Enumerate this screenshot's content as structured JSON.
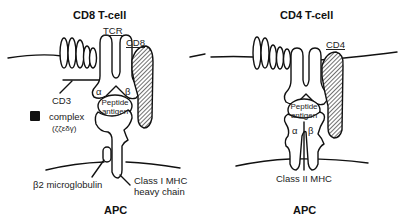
{
  "panels": [
    {
      "id": "cd8",
      "title": "CD8 T-cell",
      "bottom_label": "APC",
      "labels": {
        "tcr": "TCR",
        "coreceptor": "CD8",
        "cd3_line1": "CD3",
        "cd3_line2": "complex",
        "cd3_line3": "(ζζεδγ)",
        "alpha": "α",
        "beta": "β",
        "peptide_line1": "Peptide",
        "peptide_line2": "antigen",
        "b2m": "β2 microglobulin",
        "mhc_line1": "Class I MHC",
        "mhc_line2": "heavy chain"
      }
    },
    {
      "id": "cd4",
      "title": "CD4 T-cell",
      "bottom_label": "APC",
      "labels": {
        "coreceptor": "CD4",
        "alpha": "α",
        "beta": "β",
        "peptide_line1": "Peptide",
        "peptide_line2": "antigen",
        "mhc": "Class II MHC"
      }
    }
  ],
  "colors": {
    "stroke": "#111111",
    "hatch": "#333333",
    "background": "#ffffff"
  }
}
